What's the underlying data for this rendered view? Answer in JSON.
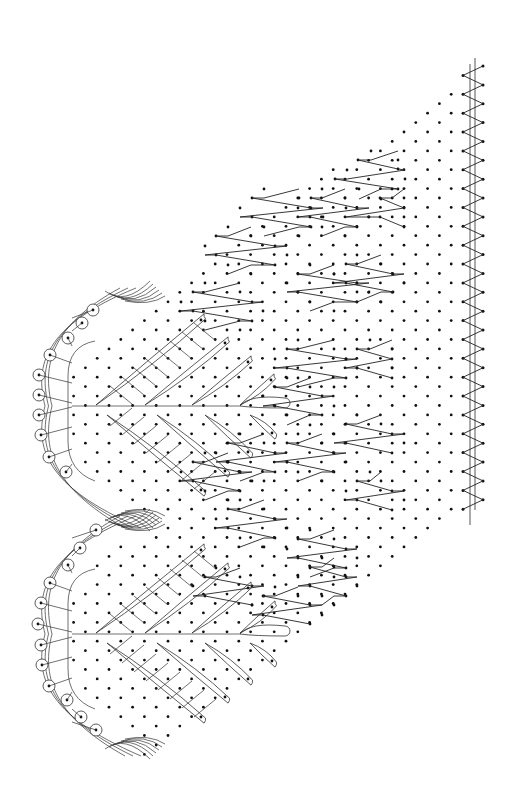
{
  "diagram": {
    "type": "bobbin-lace-pricking",
    "orientation": "rotated-90",
    "colors": {
      "ink": "#111111",
      "background": "#ffffff"
    },
    "grid": {
      "x_origin": 483,
      "x_step": 11.8,
      "y_origin": 66,
      "y_step": 9.43,
      "rows": 73
    },
    "footside": {
      "lines": [
        {
          "x": 470,
          "y1": 64,
          "y2": 525
        },
        {
          "x": 475,
          "y1": 58,
          "y2": 510
        }
      ],
      "zigzag": {
        "x_outer": 483,
        "x_inner": 463,
        "y_start": 66,
        "y_end": 510
      }
    },
    "ground_region": {
      "description": "diagonal dot lattice bounded by headside scallops and footside",
      "top_diagonal": {
        "from": [
          452,
          85
        ],
        "to": [
          153,
          302
        ]
      },
      "bottom_diagonal": {
        "from": [
          452,
          510
        ],
        "to": [
          155,
          757
        ]
      }
    },
    "half_stitch_blocks": [
      {
        "rows": [
          [
            371,
            151,
            398,
            160
          ],
          [
            358,
            160,
            398,
            169
          ],
          [
            347,
            170,
            405,
            179
          ],
          [
            335,
            179,
            398,
            189
          ],
          [
            359,
            189,
            381,
            199
          ]
        ]
      },
      {
        "rows": [
          [
            322,
            189,
            345,
            198
          ],
          [
            311,
            198,
            357,
            208
          ],
          [
            298,
            208,
            369,
            217
          ],
          [
            310,
            217,
            357,
            227
          ],
          [
            322,
            227,
            345,
            236
          ]
        ]
      },
      {
        "rows": [
          [
            264,
            189,
            299,
            198
          ],
          [
            252,
            198,
            311,
            208
          ],
          [
            240,
            208,
            323,
            217
          ],
          [
            252,
            217,
            311,
            227
          ],
          [
            264,
            227,
            299,
            236
          ]
        ]
      },
      {
        "rows": [
          [
            392,
            189,
            404,
            198
          ],
          [
            380,
            198,
            404,
            208
          ],
          [
            346,
            208,
            404,
            217
          ],
          [
            380,
            217,
            404,
            227
          ]
        ]
      },
      {
        "rows": [
          [
            228,
            227,
            251,
            236
          ],
          [
            216,
            236,
            275,
            246
          ],
          [
            205,
            246,
            287,
            255
          ],
          [
            216,
            255,
            275,
            265
          ],
          [
            228,
            265,
            251,
            274
          ]
        ]
      },
      {
        "rows": [
          [
            310,
            265,
            334,
            274
          ],
          [
            298,
            274,
            357,
            283
          ],
          [
            287,
            283,
            369,
            292
          ],
          [
            298,
            292,
            357,
            302
          ],
          [
            310,
            302,
            334,
            311
          ]
        ]
      },
      {
        "rows": [
          [
            357,
            255,
            381,
            264
          ],
          [
            346,
            264,
            393,
            274
          ],
          [
            334,
            274,
            404,
            283
          ],
          [
            346,
            283,
            393,
            292
          ],
          [
            357,
            292,
            381,
            302
          ]
        ]
      },
      {
        "rows": [
          [
            205,
            283,
            240,
            292
          ],
          [
            193,
            292,
            252,
            302
          ],
          [
            181,
            302,
            263,
            311
          ],
          [
            193,
            311,
            252,
            321
          ],
          [
            205,
            321,
            240,
            330
          ]
        ]
      },
      {
        "rows": [
          [
            298,
            340,
            334,
            349
          ],
          [
            287,
            349,
            346,
            359
          ],
          [
            275,
            359,
            357,
            368
          ],
          [
            287,
            368,
            346,
            378
          ],
          [
            298,
            378,
            334,
            387
          ]
        ]
      },
      {
        "rows": [
          [
            370,
            340,
            392,
            349
          ],
          [
            357,
            349,
            392,
            359
          ],
          [
            346,
            359,
            392,
            368
          ],
          [
            357,
            368,
            392,
            378
          ]
        ]
      },
      {
        "rows": [
          [
            287,
            378,
            310,
            387
          ],
          [
            275,
            387,
            322,
            396
          ],
          [
            263,
            396,
            334,
            406
          ],
          [
            275,
            406,
            322,
            415
          ],
          [
            287,
            415,
            310,
            425
          ]
        ]
      },
      {
        "rows": [
          [
            357,
            415,
            381,
            424
          ],
          [
            346,
            424,
            392,
            434
          ],
          [
            334,
            434,
            404,
            443
          ],
          [
            346,
            443,
            392,
            453
          ]
        ]
      },
      {
        "rows": [
          [
            298,
            434,
            322,
            443
          ],
          [
            287,
            443,
            334,
            453
          ],
          [
            275,
            453,
            346,
            462
          ],
          [
            287,
            462,
            334,
            472
          ],
          [
            298,
            472,
            322,
            481
          ]
        ]
      },
      {
        "rows": [
          [
            240,
            434,
            264,
            443
          ],
          [
            228,
            443,
            275,
            453
          ],
          [
            216,
            453,
            287,
            462
          ],
          [
            228,
            462,
            275,
            472
          ],
          [
            240,
            472,
            264,
            481
          ]
        ]
      },
      {
        "rows": [
          [
            205,
            453,
            228,
            462
          ],
          [
            193,
            462,
            240,
            472
          ],
          [
            181,
            472,
            252,
            481
          ],
          [
            193,
            481,
            240,
            491
          ],
          [
            205,
            491,
            228,
            500
          ]
        ]
      },
      {
        "rows": [
          [
            370,
            472,
            381,
            481
          ],
          [
            357,
            481,
            392,
            491
          ],
          [
            346,
            491,
            404,
            500
          ],
          [
            357,
            500,
            392,
            510
          ]
        ]
      },
      {
        "rows": [
          [
            240,
            500,
            264,
            509
          ],
          [
            228,
            509,
            275,
            519
          ],
          [
            216,
            519,
            287,
            528
          ],
          [
            228,
            528,
            275,
            538
          ],
          [
            240,
            538,
            264,
            547
          ]
        ]
      },
      {
        "rows": [
          [
            310,
            530,
            334,
            539
          ],
          [
            298,
            539,
            346,
            549
          ],
          [
            287,
            549,
            357,
            558
          ],
          [
            298,
            558,
            346,
            568
          ],
          [
            310,
            568,
            334,
            577
          ]
        ]
      },
      {
        "rows": [
          [
            216,
            568,
            240,
            577
          ],
          [
            205,
            577,
            252,
            586
          ],
          [
            193,
            586,
            264,
            596
          ],
          [
            205,
            596,
            252,
            605
          ]
        ]
      },
      {
        "rows": [
          [
            275,
            587,
            298,
            596
          ],
          [
            263,
            596,
            310,
            605
          ],
          [
            252,
            605,
            322,
            615
          ],
          [
            263,
            615,
            310,
            624
          ]
        ]
      },
      {
        "rows": [
          [
            322,
            558,
            334,
            567
          ],
          [
            310,
            567,
            346,
            577
          ],
          [
            298,
            577,
            357,
            586
          ],
          [
            310,
            586,
            346,
            596
          ],
          [
            322,
            596,
            334,
            605
          ]
        ]
      }
    ],
    "motifs": [
      {
        "name": "upper-fan",
        "center": [
          72,
          406
        ],
        "picots": [
          [
            93,
            310
          ],
          [
            82,
            323
          ],
          [
            68,
            338
          ],
          [
            50,
            355
          ],
          [
            39,
            375
          ],
          [
            39,
            395
          ],
          [
            39,
            415
          ],
          [
            41,
            435
          ],
          [
            49,
            457
          ],
          [
            66,
            472
          ]
        ],
        "leaves_upper": [
          {
            "tip": [
              204,
              317
            ],
            "base": [
              96,
              405
            ]
          },
          {
            "tip": [
              228,
              340
            ],
            "base": [
              145,
              405
            ]
          },
          {
            "tip": [
              251,
              359
            ],
            "base": [
              192,
              405
            ]
          },
          {
            "tip": [
              274,
              377
            ],
            "base": [
              240,
              405
            ]
          }
        ],
        "leaves_lower": [
          {
            "tip": [
              204,
              493
            ],
            "base": [
              107,
              415
            ]
          },
          {
            "tip": [
              228,
              474
            ],
            "base": [
              157,
              415
            ]
          },
          {
            "tip": [
              251,
              455
            ],
            "base": [
              205,
              415
            ]
          },
          {
            "tip": [
              275,
              436
            ],
            "base": [
              250,
              415
            ]
          }
        ],
        "tally": {
          "from": [
            240,
            405
          ],
          "to": [
            290,
            405
          ]
        }
      },
      {
        "name": "lower-fan",
        "center": [
          72,
          634
        ],
        "picots": [
          [
            96,
            530
          ],
          [
            80,
            548
          ],
          [
            68,
            565
          ],
          [
            50,
            583
          ],
          [
            41,
            603
          ],
          [
            38,
            624
          ],
          [
            41,
            645
          ],
          [
            42,
            665
          ],
          [
            49,
            686
          ],
          [
            67,
            700
          ],
          [
            81,
            717
          ],
          [
            96,
            730
          ]
        ],
        "leaves_upper": [
          {
            "tip": [
              204,
              547
            ],
            "base": [
              96,
              633
            ]
          },
          {
            "tip": [
              228,
              566
            ],
            "base": [
              145,
              633
            ]
          },
          {
            "tip": [
              251,
              585
            ],
            "base": [
              192,
              633
            ]
          },
          {
            "tip": [
              275,
              604
            ],
            "base": [
              240,
              633
            ]
          }
        ],
        "leaves_lower": [
          {
            "tip": [
              204,
              720
            ],
            "base": [
              107,
              643
            ]
          },
          {
            "tip": [
              228,
              700
            ],
            "base": [
              157,
              643
            ]
          },
          {
            "tip": [
              251,
              682
            ],
            "base": [
              205,
              643
            ]
          },
          {
            "tip": [
              275,
              664
            ],
            "base": [
              250,
              643
            ]
          }
        ],
        "tally": {
          "from": [
            240,
            633
          ],
          "to": [
            290,
            633
          ]
        }
      }
    ],
    "headside": {
      "scallop_tips": [
        [
          153,
          302
        ],
        [
          156,
          520
        ],
        [
          155,
          757
        ]
      ],
      "notch_point": [
        160,
        520
      ]
    }
  }
}
